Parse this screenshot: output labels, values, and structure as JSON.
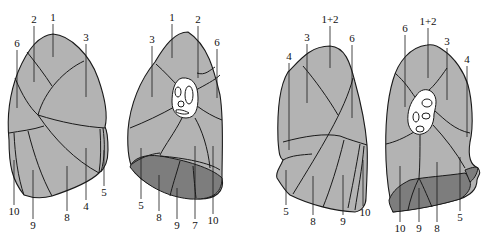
{
  "diagram": {
    "type": "anatomical-segment-diagram",
    "colors": {
      "segment_fill": "#b3b3b3",
      "inferior_surface": "#7d7d7d",
      "outline": "#1a1a1a",
      "hilum": "#ffffff"
    },
    "views": [
      {
        "id": "right-lateral",
        "labels": [
          "1",
          "2",
          "3",
          "6",
          "10",
          "9",
          "8",
          "4",
          "5"
        ]
      },
      {
        "id": "right-medial",
        "labels": [
          "1",
          "2",
          "3",
          "6",
          "5",
          "8",
          "9",
          "7",
          "10"
        ]
      },
      {
        "id": "left-lateral",
        "labels": [
          "1+2",
          "3",
          "4",
          "6",
          "5",
          "8",
          "9",
          "10"
        ]
      },
      {
        "id": "left-medial",
        "labels": [
          "1+2",
          "6",
          "3",
          "4",
          "10",
          "9",
          "8",
          "5"
        ]
      }
    ]
  }
}
